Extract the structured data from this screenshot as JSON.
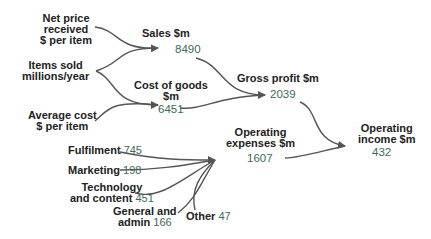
{
  "colors": {
    "label": "#222222",
    "value": "#3d6b55",
    "line": "#555555"
  },
  "nodes": {
    "net_price": {
      "lines": [
        "Net price",
        "received",
        "$ per item"
      ]
    },
    "items_sold": {
      "lines": [
        "Items sold",
        "millions/year"
      ]
    },
    "avg_cost": {
      "lines": [
        "Average cost",
        "$ per item"
      ]
    },
    "sales": {
      "label": "Sales $m",
      "value": "8490"
    },
    "cogs": {
      "lines": [
        "Cost of goods",
        "$m"
      ],
      "value": "6451"
    },
    "gross_profit": {
      "label": "Gross profit $m",
      "value": "2039"
    },
    "opex": {
      "lines": [
        "Operating",
        "expenses $m"
      ],
      "value": "1607"
    },
    "op_income": {
      "lines": [
        "Operating",
        "income $m"
      ],
      "value": "432"
    },
    "fulfilment": {
      "label": "Fulfilment",
      "value": "745"
    },
    "marketing": {
      "label": "Marketing",
      "value": "198"
    },
    "tech": {
      "lines": [
        "Technology",
        "and content"
      ],
      "value": "451"
    },
    "ga": {
      "lines": [
        "General and",
        "admin"
      ],
      "value": "166"
    },
    "other": {
      "label": "Other",
      "value": "47"
    }
  }
}
